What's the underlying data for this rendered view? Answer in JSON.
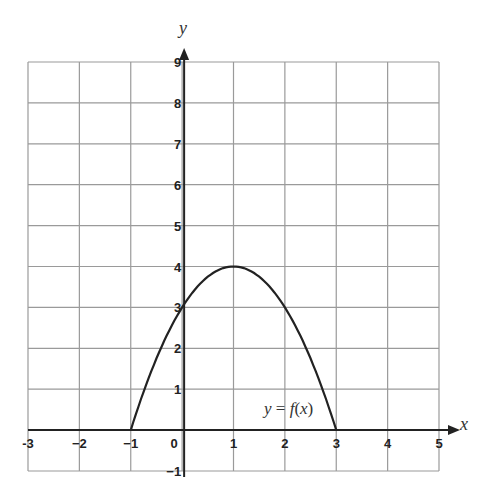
{
  "chart_data": {
    "type": "line",
    "title": "",
    "xlabel": "x",
    "ylabel": "y",
    "xlim": [
      -3,
      5
    ],
    "ylim": [
      -1,
      9
    ],
    "grid": true,
    "x_ticks": [
      "-3",
      "−2",
      "−1",
      "0",
      "1",
      "2",
      "3",
      "4",
      "5"
    ],
    "y_ticks": [
      "−1",
      "1",
      "2",
      "3",
      "4",
      "5",
      "6",
      "7",
      "8",
      "9"
    ],
    "series": [
      {
        "name": "y = f(x)",
        "function": "f(x) = -(x-1)^2 + 4",
        "x": [
          -1,
          0,
          1,
          2,
          3
        ],
        "y": [
          0,
          3,
          4,
          3,
          0
        ]
      }
    ],
    "annotations": [
      {
        "text": "y = f(x)",
        "x": 2.6,
        "y": 0.5
      }
    ],
    "colors": {
      "grid": "#9a9a9a",
      "axis": "#222222",
      "curve": "#222222"
    }
  },
  "labels": {
    "x_axis": "x",
    "y_axis": "y",
    "curve": "y = f(x)"
  }
}
